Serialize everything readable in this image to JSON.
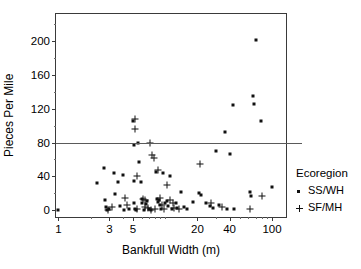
{
  "chart_data": {
    "type": "scatter",
    "title": "",
    "xlabel": "Bankfull Width (m)",
    "ylabel": "Pieces Per Mile",
    "xscale": "log",
    "yscale": "linear",
    "xlim": [
      0.95,
      135
    ],
    "ylim": [
      -8,
      232
    ],
    "xticks": [
      1,
      3,
      5,
      20,
      40,
      100
    ],
    "xtick_labels": [
      "1",
      "3",
      "5",
      "20",
      "40",
      "100"
    ],
    "xminor_ticks": [
      2,
      4,
      6,
      7,
      8,
      9,
      10,
      30,
      50,
      60,
      70,
      80,
      90
    ],
    "yticks": [
      0,
      40,
      80,
      120,
      160,
      200
    ],
    "ytick_labels": [
      "0",
      "40",
      "80",
      "120",
      "160",
      "200"
    ],
    "yminor_ticks": [
      20,
      60,
      100,
      140,
      180,
      220
    ],
    "grid": false,
    "legend_position": "right",
    "legend_title": "Ecoregion",
    "reference_lines": [
      {
        "axis": "y",
        "value": 80,
        "color": "#5a5a5a",
        "label": ""
      }
    ],
    "series": [
      {
        "name": "SS/WH",
        "marker": "square",
        "color": "#111111",
        "points": [
          [
            1.0,
            0
          ],
          [
            2.3,
            32
          ],
          [
            2.7,
            50
          ],
          [
            2.75,
            12
          ],
          [
            2.8,
            4
          ],
          [
            2.85,
            0
          ],
          [
            3.0,
            1
          ],
          [
            3.3,
            44
          ],
          [
            3.4,
            19
          ],
          [
            3.6,
            33
          ],
          [
            3.8,
            5
          ],
          [
            4.0,
            42
          ],
          [
            4.1,
            0
          ],
          [
            4.6,
            2
          ],
          [
            5.0,
            105
          ],
          [
            5.05,
            77
          ],
          [
            5.1,
            34
          ],
          [
            5.15,
            9
          ],
          [
            5.2,
            1
          ],
          [
            5.3,
            0
          ],
          [
            5.6,
            79
          ],
          [
            5.7,
            57
          ],
          [
            5.9,
            33
          ],
          [
            6.0,
            13
          ],
          [
            6.1,
            8
          ],
          [
            6.3,
            0
          ],
          [
            6.6,
            7
          ],
          [
            6.8,
            11
          ],
          [
            7.0,
            2
          ],
          [
            7.4,
            0
          ],
          [
            8.2,
            45
          ],
          [
            8.4,
            13
          ],
          [
            8.6,
            10
          ],
          [
            8.8,
            12
          ],
          [
            9.0,
            6
          ],
          [
            9.2,
            2
          ],
          [
            9.6,
            44
          ],
          [
            10.0,
            9
          ],
          [
            10.3,
            11
          ],
          [
            10.6,
            5
          ],
          [
            11.0,
            41
          ],
          [
            11.5,
            2
          ],
          [
            12.5,
            8
          ],
          [
            13.0,
            3
          ],
          [
            14.0,
            22
          ],
          [
            15.0,
            4
          ],
          [
            16.0,
            2
          ],
          [
            18.0,
            10
          ],
          [
            20.5,
            20
          ],
          [
            21.5,
            18
          ],
          [
            24.0,
            9
          ],
          [
            26.0,
            5
          ],
          [
            28.0,
            3
          ],
          [
            30.0,
            70
          ],
          [
            32.0,
            6
          ],
          [
            36.0,
            93
          ],
          [
            38.0,
            1
          ],
          [
            40.0,
            66
          ],
          [
            43.0,
            125
          ],
          [
            44.0,
            2
          ],
          [
            62.0,
            22
          ],
          [
            63.0,
            17
          ],
          [
            66.0,
            135
          ],
          [
            68.0,
            126
          ],
          [
            70.0,
            201
          ],
          [
            78.0,
            105
          ],
          [
            100.0,
            27
          ]
        ]
      },
      {
        "name": "SF/MH",
        "marker": "plus",
        "color": "#111111",
        "points": [
          [
            2.9,
            0
          ],
          [
            3.2,
            4
          ],
          [
            4.2,
            14
          ],
          [
            4.4,
            6
          ],
          [
            5.2,
            108
          ],
          [
            5.25,
            96
          ],
          [
            5.4,
            40
          ],
          [
            5.5,
            1
          ],
          [
            6.2,
            13
          ],
          [
            6.4,
            12
          ],
          [
            6.5,
            4
          ],
          [
            6.9,
            3
          ],
          [
            7.2,
            80
          ],
          [
            7.3,
            0
          ],
          [
            7.6,
            65
          ],
          [
            7.8,
            62
          ],
          [
            8.0,
            1
          ],
          [
            8.5,
            48
          ],
          [
            8.9,
            14
          ],
          [
            9.4,
            6
          ],
          [
            9.8,
            1
          ],
          [
            10.5,
            30
          ],
          [
            11.0,
            12
          ],
          [
            11.8,
            8
          ],
          [
            12.2,
            3
          ],
          [
            13.5,
            1
          ],
          [
            21.0,
            55
          ],
          [
            27.0,
            8
          ],
          [
            34.0,
            4
          ],
          [
            62.5,
            1
          ],
          [
            80.0,
            17
          ]
        ]
      }
    ]
  }
}
